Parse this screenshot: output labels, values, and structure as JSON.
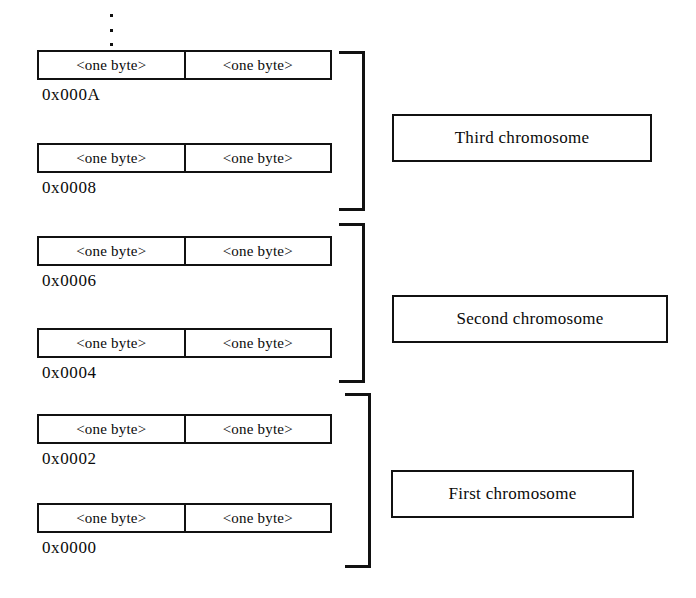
{
  "diagram": {
    "ellipsis_icon": "vertical-ellipsis-icon",
    "byte_label": "<one byte>",
    "rows": [
      {
        "address": "0x000A",
        "left_byte": "<one byte>",
        "right_byte": "<one byte>"
      },
      {
        "address": "0x0008",
        "left_byte": "<one byte>",
        "right_byte": "<one byte>"
      },
      {
        "address": "0x0006",
        "left_byte": "<one byte>",
        "right_byte": "<one byte>"
      },
      {
        "address": "0x0004",
        "left_byte": "<one byte>",
        "right_byte": "<one byte>"
      },
      {
        "address": "0x0002",
        "left_byte": "<one byte>",
        "right_byte": "<one byte>"
      },
      {
        "address": "0x0000",
        "left_byte": "<one byte>",
        "right_byte": "<one byte>"
      }
    ],
    "groups": [
      {
        "label": "Third chromosome"
      },
      {
        "label": "Second chromosome"
      },
      {
        "label": "First chromosome"
      }
    ],
    "colors": {
      "ink": "#111111",
      "background": "#ffffff"
    }
  }
}
